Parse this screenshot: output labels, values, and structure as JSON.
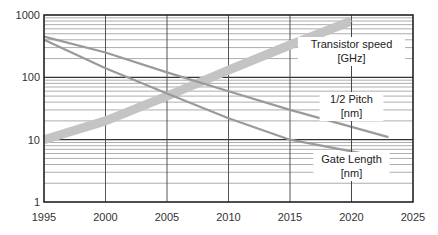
{
  "chart_data": {
    "type": "line",
    "title": "",
    "xlabel": "",
    "ylabel": "",
    "x_scale": "linear",
    "y_scale": "log",
    "xlim": [
      1995,
      2025
    ],
    "ylim": [
      1,
      1000
    ],
    "x_ticks": [
      "1995",
      "2000",
      "2005",
      "2010",
      "2015",
      "2020",
      "2025"
    ],
    "y_ticks": [
      "1",
      "10",
      "100",
      "1000"
    ],
    "grid": true,
    "legend": "inline labels near right side",
    "series": [
      {
        "name": "Transistor speed [GHz]",
        "label_line1": "Transistor speed",
        "label_line2": "[GHz]",
        "style": "thick",
        "color": "#c4c4c4",
        "x": [
          1995,
          2000,
          2005,
          2010,
          2015,
          2020
        ],
        "values": [
          10,
          20,
          50,
          130,
          330,
          800
        ]
      },
      {
        "name": "1/2 Pitch [nm]",
        "label_line1": "1/2 Pitch",
        "label_line2": "[nm]",
        "style": "thin",
        "color": "#9a9a9a",
        "x": [
          1995,
          2000,
          2005,
          2010,
          2015,
          2020,
          2023
        ],
        "values": [
          450,
          250,
          120,
          60,
          30,
          16,
          11
        ]
      },
      {
        "name": "Gate Length [nm]",
        "label_line1": "Gate Length",
        "label_line2": "[nm]",
        "style": "thin",
        "color": "#9a9a9a",
        "x": [
          1995,
          2000,
          2005,
          2010,
          2015,
          2020,
          2023
        ],
        "values": [
          400,
          140,
          55,
          22,
          10,
          6.5,
          5
        ]
      }
    ]
  }
}
